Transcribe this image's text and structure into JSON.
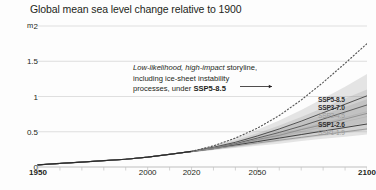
{
  "chart_data": {
    "type": "line",
    "title": "Global mean sea level change relative to 1900",
    "xlabel": "",
    "ylabel": "m",
    "unit": "m",
    "xlim": [
      1950,
      2100
    ],
    "ylim": [
      0,
      2
    ],
    "grid": true,
    "yticks": [
      "2",
      "1.5",
      "1",
      "0.5",
      "0"
    ],
    "ytick_values": [
      2,
      1.5,
      1,
      0.5,
      0
    ],
    "xticks": [
      "1950",
      "2000",
      "2020",
      "2050",
      "2100"
    ],
    "xtick_values": [
      1950,
      2000,
      2020,
      2050,
      2100
    ],
    "xtick_bold": [
      "1950",
      "2100"
    ],
    "legend_position": "right",
    "x": [
      1950,
      1960,
      1970,
      1980,
      1990,
      2000,
      2010,
      2020,
      2030,
      2040,
      2050,
      2060,
      2070,
      2080,
      2090,
      2100
    ],
    "historical": {
      "name": "Historical",
      "x": [
        1950,
        1960,
        1970,
        1980,
        1990,
        2000,
        2010,
        2020
      ],
      "values": [
        0.03,
        0.05,
        0.07,
        0.09,
        0.11,
        0.14,
        0.18,
        0.22
      ]
    },
    "series": [
      {
        "name": "SSP5-8.5",
        "color": "#4a4a4a",
        "values": [
          0.03,
          0.05,
          0.07,
          0.09,
          0.11,
          0.14,
          0.18,
          0.22,
          0.28,
          0.35,
          0.44,
          0.54,
          0.65,
          0.77,
          0.89,
          1.01
        ],
        "band_low": [
          0.03,
          0.05,
          0.07,
          0.09,
          0.11,
          0.14,
          0.18,
          0.21,
          0.25,
          0.3,
          0.37,
          0.44,
          0.52,
          0.6,
          0.69,
          0.78
        ],
        "band_high": [
          0.03,
          0.05,
          0.07,
          0.09,
          0.11,
          0.14,
          0.18,
          0.23,
          0.31,
          0.41,
          0.53,
          0.66,
          0.81,
          0.97,
          1.14,
          1.32
        ]
      },
      {
        "name": "SSP3-7.0",
        "color": "#585858",
        "values": [
          0.03,
          0.05,
          0.07,
          0.09,
          0.11,
          0.14,
          0.18,
          0.22,
          0.27,
          0.33,
          0.41,
          0.49,
          0.58,
          0.68,
          0.78,
          0.88
        ],
        "band_low": [
          0.03,
          0.05,
          0.07,
          0.09,
          0.11,
          0.14,
          0.18,
          0.21,
          0.25,
          0.3,
          0.35,
          0.42,
          0.49,
          0.56,
          0.64,
          0.71
        ],
        "band_high": [
          0.03,
          0.05,
          0.07,
          0.09,
          0.11,
          0.14,
          0.18,
          0.23,
          0.3,
          0.38,
          0.48,
          0.59,
          0.71,
          0.84,
          0.97,
          1.1
        ]
      },
      {
        "name": "SSP2-4.5",
        "color": "#8f8f8f",
        "values": [
          0.03,
          0.05,
          0.07,
          0.09,
          0.11,
          0.14,
          0.18,
          0.22,
          0.27,
          0.32,
          0.39,
          0.45,
          0.53,
          0.6,
          0.68,
          0.76
        ],
        "band_low": [
          0.03,
          0.05,
          0.07,
          0.09,
          0.11,
          0.14,
          0.18,
          0.21,
          0.25,
          0.29,
          0.34,
          0.39,
          0.45,
          0.51,
          0.57,
          0.63
        ],
        "band_high": [
          0.03,
          0.05,
          0.07,
          0.09,
          0.11,
          0.14,
          0.18,
          0.23,
          0.29,
          0.36,
          0.45,
          0.54,
          0.64,
          0.74,
          0.85,
          0.96
        ]
      },
      {
        "name": "SSP1-2.6",
        "color": "#3a3a3a",
        "values": [
          0.03,
          0.05,
          0.07,
          0.09,
          0.11,
          0.14,
          0.18,
          0.22,
          0.26,
          0.31,
          0.36,
          0.41,
          0.46,
          0.51,
          0.56,
          0.61
        ],
        "band_low": [
          0.03,
          0.05,
          0.07,
          0.09,
          0.11,
          0.14,
          0.18,
          0.21,
          0.24,
          0.28,
          0.32,
          0.36,
          0.4,
          0.44,
          0.48,
          0.52
        ],
        "band_high": [
          0.03,
          0.05,
          0.07,
          0.09,
          0.11,
          0.14,
          0.18,
          0.23,
          0.28,
          0.34,
          0.41,
          0.48,
          0.55,
          0.63,
          0.71,
          0.79
        ]
      },
      {
        "name": "SSP1-1.9",
        "color": "#9a9a9a",
        "values": [
          0.03,
          0.05,
          0.07,
          0.09,
          0.11,
          0.14,
          0.18,
          0.22,
          0.26,
          0.3,
          0.34,
          0.38,
          0.42,
          0.46,
          0.5,
          0.54
        ],
        "band_low": [
          0.03,
          0.05,
          0.07,
          0.09,
          0.11,
          0.14,
          0.18,
          0.21,
          0.24,
          0.27,
          0.3,
          0.33,
          0.37,
          0.4,
          0.43,
          0.46
        ],
        "band_high": [
          0.03,
          0.05,
          0.07,
          0.09,
          0.11,
          0.14,
          0.18,
          0.23,
          0.28,
          0.33,
          0.39,
          0.45,
          0.51,
          0.58,
          0.65,
          0.72
        ]
      }
    ],
    "storyline": {
      "name": "Low-likelihood, high-impact storyline under SSP5-8.5",
      "style": "dotted",
      "color": "#555555",
      "x": [
        2020,
        2030,
        2040,
        2050,
        2060,
        2070,
        2080,
        2090,
        2100
      ],
      "values": [
        0.22,
        0.3,
        0.41,
        0.55,
        0.73,
        0.95,
        1.2,
        1.47,
        1.75
      ]
    },
    "annotation": {
      "line1_italic": "Low-likelihood, high-impact",
      "line1_rest": " storyline,",
      "line2": "including ice-sheet instability",
      "line3_rest": "processes, under ",
      "line3_bold": "SSP5-8.5",
      "arrow": "→"
    }
  },
  "legend": {
    "items": [
      {
        "label": "SSP5-8.5",
        "color": "#2f2f2f",
        "bold": true
      },
      {
        "label": "SSP3-7.0",
        "color": "#2f2f2f",
        "bold": true
      },
      {
        "label": "SSP2-4.5",
        "color": "#9b9b9b",
        "bold": false
      },
      {
        "label": "SSP1-2.6",
        "color": "#2f2f2f",
        "bold": true
      },
      {
        "label": "SSP1-1.9",
        "color": "#9b9b9b",
        "bold": false
      }
    ]
  }
}
